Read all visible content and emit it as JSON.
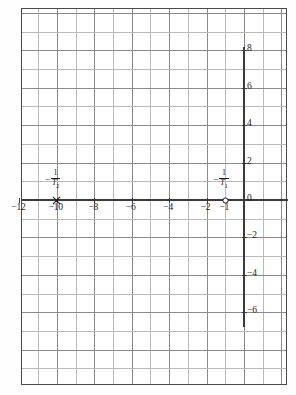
{
  "figure": {
    "kind": "s-plane pole-zero plot on graph paper",
    "background_color": "#ffffff",
    "frame_color": "#4a4a4a",
    "grid_color": "#b9b9b9",
    "axis_color": "#3a3a3a"
  },
  "chart_data": {
    "type": "scatter",
    "title": "",
    "xlabel": "",
    "ylabel": "",
    "xlim": [
      -12.4,
      1.8
    ],
    "ylim": [
      -10.1,
      9.9
    ],
    "grid": true,
    "grid_step": 1,
    "legend": "none",
    "x_tick_labels": [
      "-12",
      "-10",
      "-8",
      "-6",
      "-4",
      "-2",
      "-1"
    ],
    "x_tick_values": [
      -12,
      -10,
      -8,
      -6,
      -4,
      -2,
      -1
    ],
    "y_tick_labels": [
      "8",
      "6",
      "4",
      "2",
      "0",
      "-2",
      "-4",
      "-6"
    ],
    "y_tick_values": [
      8,
      6,
      4,
      2,
      0,
      -2,
      -4,
      -6
    ],
    "series": [
      {
        "name": "pole",
        "marker": "cross",
        "points": [
          {
            "x": -10,
            "y": 0,
            "label": "-1/T2"
          }
        ]
      },
      {
        "name": "zero",
        "marker": "open-circle",
        "points": [
          {
            "x": -1,
            "y": 0,
            "label": "-1/T1"
          }
        ]
      }
    ],
    "annotations": [
      {
        "name": "pole-label",
        "x": -10,
        "y": 1.0,
        "minus": "−",
        "numerator": "1",
        "denominator": "T",
        "subscript": "2"
      },
      {
        "name": "zero-label",
        "x": -1,
        "y": 1.0,
        "minus": "−",
        "numerator": "1",
        "denominator": "T",
        "subscript": "1"
      }
    ]
  }
}
